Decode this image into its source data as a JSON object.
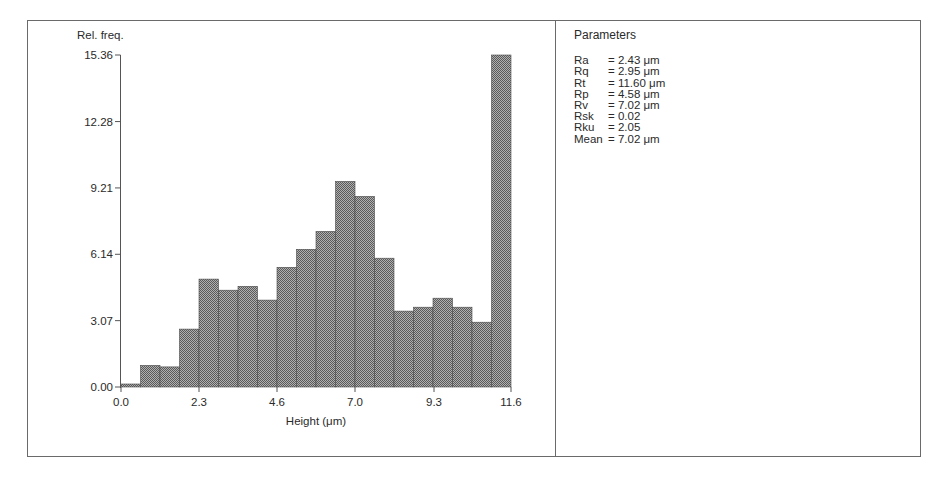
{
  "chart_data": {
    "type": "bar",
    "subtype": "histogram",
    "title": "",
    "xlabel": "Height (μm)",
    "ylabel": "Rel. freq.",
    "xlim": [
      0.0,
      11.6
    ],
    "ylim": [
      0.0,
      15.36
    ],
    "x_ticks": [
      "0.0",
      "2.3",
      "4.6",
      "7.0",
      "9.3",
      "11.6"
    ],
    "y_ticks": [
      "0.00",
      "3.07",
      "6.14",
      "9.21",
      "12.28",
      "15.36"
    ],
    "bin_count": 20,
    "bin_width": 0.58,
    "bin_edges": [
      0.0,
      0.58,
      1.16,
      1.74,
      2.32,
      2.9,
      3.48,
      4.06,
      4.64,
      5.22,
      5.8,
      6.38,
      6.96,
      7.54,
      8.12,
      8.7,
      9.28,
      9.86,
      10.44,
      11.02,
      11.6
    ],
    "values": [
      0.14,
      1.0,
      0.93,
      2.68,
      4.99,
      4.48,
      4.66,
      4.02,
      5.54,
      6.37,
      7.2,
      9.51,
      8.82,
      5.96,
      3.51,
      3.69,
      4.11,
      3.69,
      3.0,
      15.36
    ],
    "grid": false,
    "legend": null,
    "bar_fill": "#8a8a8a",
    "bar_pattern": "dithered-halftone"
  },
  "axes": {
    "y_label": "Rel. freq.",
    "x_label": "Height (μm)"
  },
  "parameters": {
    "title": "Parameters",
    "rows": [
      {
        "name": "Ra",
        "value": "= 2.43 μm"
      },
      {
        "name": "Rq",
        "value": "= 2.95 μm"
      },
      {
        "name": "Rt",
        "value": "= 11.60 μm"
      },
      {
        "name": "Rp",
        "value": "= 4.58 μm"
      },
      {
        "name": "Rv",
        "value": "= 7.02 μm"
      },
      {
        "name": "Rsk",
        "value": "= 0.02"
      },
      {
        "name": "Rku",
        "value": "= 2.05"
      },
      {
        "name": "Mean",
        "value": "= 7.02 μm"
      }
    ]
  }
}
